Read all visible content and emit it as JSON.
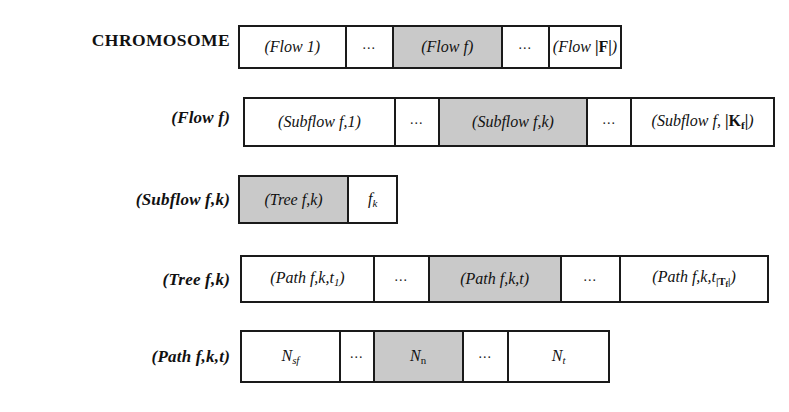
{
  "figure": {
    "shade_color": "#c9c9c9",
    "border_color": "#1a1a1a",
    "background": "#ffffff"
  },
  "rows": [
    {
      "id": "chromosome",
      "label": "CHROMOSOME",
      "cells": [
        {
          "text": "(Flow 1)",
          "shaded": false,
          "kind": "item"
        },
        {
          "text": "...",
          "shaded": false,
          "kind": "ellipsis"
        },
        {
          "text": "(Flow f)",
          "shaded": true,
          "kind": "item"
        },
        {
          "text": "...",
          "shaded": false,
          "kind": "ellipsis"
        },
        {
          "text": "(Flow |F|)",
          "shaded": false,
          "kind": "item"
        }
      ]
    },
    {
      "id": "flow-f",
      "label": "(Flow f)",
      "cells": [
        {
          "text": "(Subflow f,1)",
          "shaded": false,
          "kind": "item"
        },
        {
          "text": "...",
          "shaded": false,
          "kind": "ellipsis"
        },
        {
          "text": "(Subflow f,k)",
          "shaded": true,
          "kind": "item"
        },
        {
          "text": "...",
          "shaded": false,
          "kind": "ellipsis"
        },
        {
          "text": "(Subflow f, |Kf|)",
          "shaded": false,
          "kind": "item"
        }
      ]
    },
    {
      "id": "subflow-fk",
      "label": "(Subflow f,k)",
      "cells": [
        {
          "text": "(Tree f,k)",
          "shaded": true,
          "kind": "item"
        },
        {
          "text": "fk",
          "shaded": false,
          "kind": "item"
        }
      ]
    },
    {
      "id": "tree-fk",
      "label": "(Tree f,k)",
      "cells": [
        {
          "text": "(Path f,k,t1)",
          "shaded": false,
          "kind": "item"
        },
        {
          "text": "...",
          "shaded": false,
          "kind": "ellipsis"
        },
        {
          "text": "(Path f,k,t)",
          "shaded": true,
          "kind": "item"
        },
        {
          "text": "...",
          "shaded": false,
          "kind": "ellipsis"
        },
        {
          "text": "(Path f,k,t|Tf|)",
          "shaded": false,
          "kind": "item"
        }
      ]
    },
    {
      "id": "path-fkt",
      "label": "(Path f,k,t)",
      "cells": [
        {
          "text": "Nsf",
          "shaded": false,
          "kind": "item"
        },
        {
          "text": "...",
          "shaded": false,
          "kind": "ellipsis"
        },
        {
          "text": "Nn",
          "shaded": true,
          "kind": "item"
        },
        {
          "text": "...",
          "shaded": false,
          "kind": "ellipsis"
        },
        {
          "text": "Nt",
          "shaded": false,
          "kind": "item"
        }
      ]
    }
  ]
}
